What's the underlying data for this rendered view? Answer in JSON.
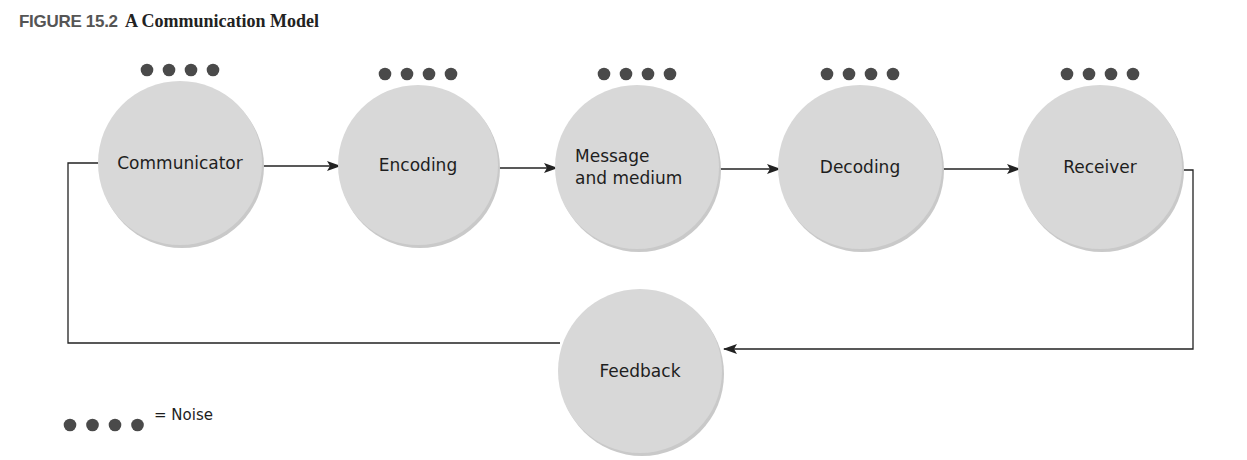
{
  "figure": {
    "label": "FIGURE 15.2",
    "title": "A Communication Model"
  },
  "nodes": [
    {
      "id": "communicator",
      "lines": [
        "Communicator"
      ],
      "noise": true
    },
    {
      "id": "encoding",
      "lines": [
        "Encoding"
      ],
      "noise": true
    },
    {
      "id": "message-and-medium",
      "lines": [
        "Message",
        "and medium"
      ],
      "noise": true
    },
    {
      "id": "decoding",
      "lines": [
        "Decoding"
      ],
      "noise": true
    },
    {
      "id": "receiver",
      "lines": [
        "Receiver"
      ],
      "noise": true
    },
    {
      "id": "feedback",
      "lines": [
        "Feedback"
      ],
      "noise": false
    }
  ],
  "edges": [
    {
      "from": "communicator",
      "to": "encoding"
    },
    {
      "from": "encoding",
      "to": "message-and-medium"
    },
    {
      "from": "message-and-medium",
      "to": "decoding"
    },
    {
      "from": "decoding",
      "to": "receiver"
    },
    {
      "from": "receiver",
      "to": "feedback"
    },
    {
      "from": "feedback",
      "to": "communicator"
    }
  ],
  "legend": {
    "symbol": "noise-dots",
    "text": "= Noise"
  },
  "colors": {
    "node_fill": "#d8d8d8",
    "noise_dot": "#4a4a4a",
    "line": "#222222"
  }
}
